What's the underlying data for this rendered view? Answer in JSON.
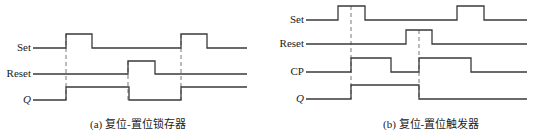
{
  "colors": {
    "line": "#3a3a3a",
    "dash": "#555555",
    "text": "#222222",
    "background": "#ffffff"
  },
  "panel_a": {
    "caption": "(a) 复位-置位锁存器",
    "signals": [
      {
        "label": "Set",
        "italic": false,
        "y_low": 48,
        "y_high": 34,
        "x_start": 33,
        "x_end": 247,
        "initial": "low",
        "edges": [
          66,
          92,
          181,
          207
        ]
      },
      {
        "label": "Reset",
        "italic": false,
        "y_low": 74,
        "y_high": 61,
        "x_start": 33,
        "x_end": 247,
        "initial": "low",
        "edges": [
          128,
          155
        ]
      },
      {
        "label": "Q",
        "italic": true,
        "y_low": 100,
        "y_high": 87,
        "x_start": 33,
        "x_end": 247,
        "initial": "low",
        "edges": [
          66,
          129,
          181
        ]
      }
    ],
    "dashed_markers": [
      {
        "x": 66,
        "y_top": 34,
        "y_bottom": 100
      },
      {
        "x": 128,
        "y_top": 61,
        "y_bottom": 100
      },
      {
        "x": 181,
        "y_top": 34,
        "y_bottom": 100
      }
    ]
  },
  "panel_b": {
    "caption": "(b) 复位-置位触发器",
    "signals": [
      {
        "label": "Set",
        "italic": false,
        "y_low": 20,
        "y_high": 6,
        "x_start": 36,
        "x_end": 257,
        "initial": "low",
        "edges": [
          68,
          95,
          187,
          214
        ]
      },
      {
        "label": "Reset",
        "italic": false,
        "y_low": 44,
        "y_high": 30,
        "x_start": 36,
        "x_end": 257,
        "initial": "low",
        "edges": [
          136,
          162
        ]
      },
      {
        "label": "CP",
        "italic": false,
        "y_low": 72,
        "y_high": 58,
        "x_start": 36,
        "x_end": 257,
        "initial": "low",
        "edges": [
          81,
          121,
          149,
          201
        ]
      },
      {
        "label": "Q",
        "italic": true,
        "y_low": 99,
        "y_high": 85,
        "x_start": 36,
        "x_end": 257,
        "initial": "low",
        "edges": [
          81,
          149
        ]
      }
    ],
    "dashed_markers": [
      {
        "x": 81,
        "y_top": 6,
        "y_bottom": 99
      },
      {
        "x": 149,
        "y_top": 30,
        "y_bottom": 99
      }
    ]
  }
}
